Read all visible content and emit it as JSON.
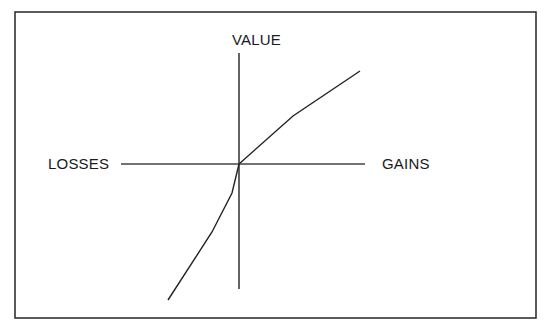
{
  "diagram": {
    "labels": {
      "value": "VALUE",
      "losses": "LOSSES",
      "gains": "GAINS"
    },
    "colors": {
      "line": "#222222",
      "border": "#333333",
      "background": "#ffffff"
    }
  }
}
